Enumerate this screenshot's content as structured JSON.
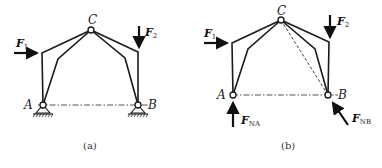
{
  "figure": {
    "panels": [
      {
        "id": "a",
        "caption": "(a)",
        "points": {
          "C": {
            "label": "C",
            "x": 91,
            "y": 30
          },
          "A": {
            "label": "A",
            "x": 43,
            "y": 105
          },
          "B": {
            "label": "B",
            "x": 138,
            "y": 105
          }
        },
        "forces": {
          "F1": {
            "label": "F",
            "sub": "1"
          },
          "F2": {
            "label": "F",
            "sub": "2"
          }
        },
        "supports": "fixed pin supports with ground hatching at A and B"
      },
      {
        "id": "b",
        "caption": "(b)",
        "points": {
          "C": {
            "label": "C",
            "x": 281,
            "y": 20
          },
          "A": {
            "label": "A",
            "x": 233,
            "y": 95
          },
          "B": {
            "label": "B",
            "x": 328,
            "y": 95
          }
        },
        "forces": {
          "F1": {
            "label": "F",
            "sub": "1"
          },
          "F2": {
            "label": "F",
            "sub": "2"
          },
          "FNA": {
            "label": "F",
            "sub": "NA"
          },
          "FNB": {
            "label": "F",
            "sub": "NB"
          }
        },
        "supports": "free-body diagram: supports replaced by reaction forces F_NA (vertical up) and F_NB (along line BC)"
      }
    ],
    "colors": {
      "line": "#1a1a1a",
      "background": "#ffffff"
    }
  }
}
